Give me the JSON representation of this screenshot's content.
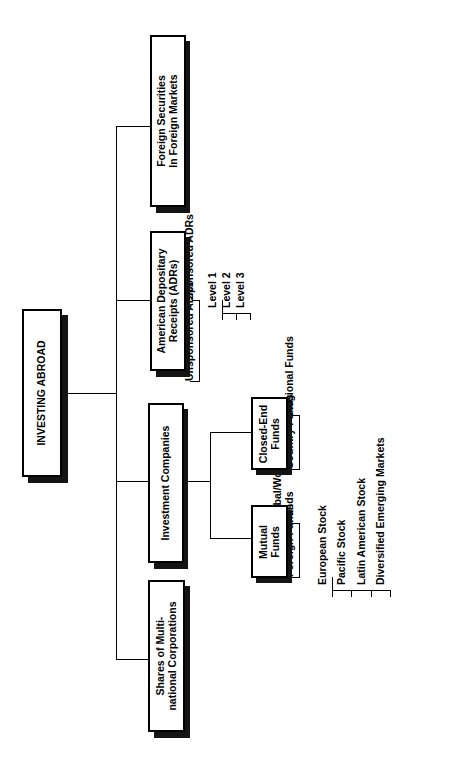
{
  "diagram": {
    "title": "INVESTING ABROAD",
    "orientation": "rotated-90-ccw",
    "root": {
      "label": "INVESTING ABROAD"
    },
    "branches": [
      {
        "id": "foreign-securities",
        "label": "Foreign Securities\nIn Foreign Markets"
      },
      {
        "id": "adrs",
        "label": "American Depositary\nReceipts (ADRs)"
      },
      {
        "id": "investment-companies",
        "label": "Investment Companies"
      },
      {
        "id": "multinational",
        "label": "Shares of Multi-\nnational Corporations"
      }
    ],
    "adr_children": [
      {
        "id": "sponsored-adrs",
        "label": "Sponsored ADRs"
      },
      {
        "id": "unsponsored-adrs",
        "label": "Unsponsored ADRs"
      }
    ],
    "adr_levels": [
      {
        "id": "level-1",
        "label": "Level 1"
      },
      {
        "id": "level-2",
        "label": "Level 2"
      },
      {
        "id": "level-3",
        "label": "Level 3"
      }
    ],
    "investment_company_children": [
      {
        "id": "closed-end-funds",
        "label": "Closed-End\nFunds"
      },
      {
        "id": "mutual-funds",
        "label": "Mutual\nFunds"
      }
    ],
    "closed_end_children": [
      {
        "id": "regional-funds",
        "label": "Regional Funds"
      },
      {
        "id": "country-funds",
        "label": "Country Funds"
      }
    ],
    "mutual_fund_children": [
      {
        "id": "global-world-funds",
        "label": "Global/World\nFunds"
      },
      {
        "id": "international-foreign-funds",
        "label": "International/\nForeign Funds"
      }
    ],
    "international_fund_children": [
      {
        "id": "european-stock",
        "label": "European Stock"
      },
      {
        "id": "pacific-stock",
        "label": "Pacific Stock"
      },
      {
        "id": "latin-american-stock",
        "label": "Latin American Stock"
      },
      {
        "id": "diversified-emerging-markets",
        "label": "Diversified Emerging Markets"
      }
    ],
    "colors": {
      "line": "#000000",
      "box_fill": "#ffffff",
      "box_border": "#000000",
      "shadow": "#141414"
    }
  }
}
